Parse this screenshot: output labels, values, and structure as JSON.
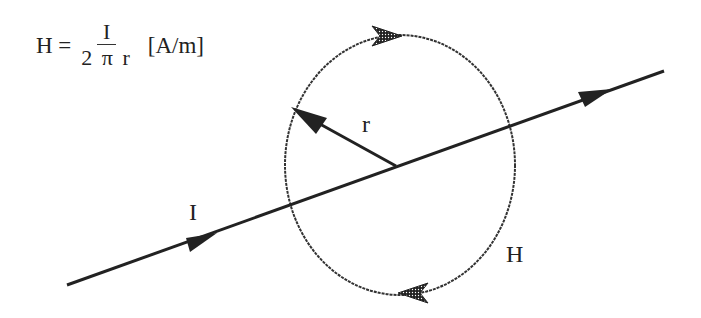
{
  "formula": {
    "lhs": "H =",
    "numerator": "I",
    "denominator": "2 π r",
    "unit": "[A/m]"
  },
  "labels": {
    "radius": "r",
    "current": "I",
    "field": "H"
  },
  "colors": {
    "ink": "#222222",
    "background": "#ffffff"
  }
}
